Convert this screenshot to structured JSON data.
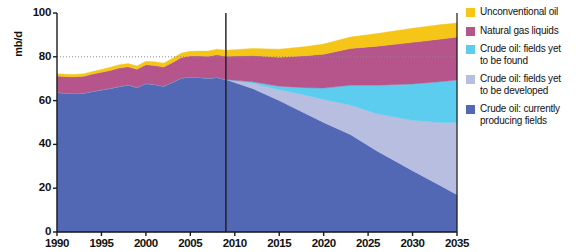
{
  "chart_data": {
    "type": "area",
    "title": "",
    "subtitle": "",
    "xlabel": "",
    "ylabel": "mb/d",
    "xlim": [
      1990,
      2035
    ],
    "ylim": [
      0,
      100
    ],
    "grid": "dotted horizontal gridline at 80 mb/d",
    "legend_position": "right",
    "stacked": true,
    "annotations": [
      {
        "type": "vertical-line",
        "x": 2009,
        "label": "historical / projection divider"
      }
    ],
    "x_tick_labels": [
      "1990",
      "1995",
      "2000",
      "2005",
      "2010",
      "2015",
      "2020",
      "2025",
      "2030",
      "2035"
    ],
    "y_tick_labels": [
      "0",
      "20",
      "40",
      "60",
      "80",
      "100"
    ],
    "x": [
      1990,
      1991,
      1992,
      1993,
      1994,
      1995,
      1996,
      1997,
      1998,
      1999,
      2000,
      2001,
      2002,
      2003,
      2004,
      2005,
      2006,
      2007,
      2008,
      2009,
      2012,
      2015,
      2018,
      2020,
      2023,
      2026,
      2030,
      2033,
      2035
    ],
    "series": [
      {
        "name": "Crude oil: currently producing fields",
        "color": "#5268B5",
        "values": [
          63.8,
          63.4,
          63.2,
          63.4,
          64.2,
          64.9,
          65.6,
          66.4,
          67.2,
          66.0,
          67.8,
          67.4,
          66.6,
          68.4,
          70.3,
          70.8,
          70.6,
          70.2,
          70.6,
          69.6,
          65.5,
          60.0,
          54.0,
          50.0,
          44.5,
          37.0,
          28.0,
          21.5,
          17.0
        ]
      },
      {
        "name": "Crude oil: fields yet to be developed",
        "color": "#B8BEE0",
        "values": [
          0,
          0,
          0,
          0,
          0,
          0,
          0,
          0,
          0,
          0,
          0,
          0,
          0,
          0,
          0,
          0,
          0,
          0,
          0,
          0,
          2.5,
          5.0,
          8.5,
          10.5,
          13.5,
          17.0,
          23.0,
          28.5,
          33.0
        ]
      },
      {
        "name": "Crude oil: fields yet to be found",
        "color": "#5CCDEE",
        "values": [
          0,
          0,
          0,
          0,
          0,
          0,
          0,
          0,
          0,
          0,
          0,
          0,
          0,
          0,
          0,
          0,
          0,
          0,
          0,
          0,
          0.6,
          1.6,
          3.4,
          5.2,
          9.0,
          13.0,
          16.6,
          18.6,
          19.4
        ]
      },
      {
        "name": "Natural gas liquids",
        "color": "#B5558C",
        "values": [
          7.4,
          7.5,
          7.6,
          7.7,
          7.9,
          8.0,
          8.2,
          8.5,
          8.2,
          8.3,
          8.6,
          8.6,
          8.7,
          9.0,
          9.4,
          9.6,
          9.8,
          10.0,
          10.3,
          10.6,
          12.0,
          13.2,
          14.6,
          15.5,
          16.8,
          17.8,
          19.0,
          19.4,
          19.6
        ]
      },
      {
        "name": "Unconventional oil",
        "color": "#F5C518",
        "values": [
          1.1,
          1.1,
          1.1,
          1.2,
          1.2,
          1.3,
          1.4,
          1.5,
          1.5,
          1.5,
          1.6,
          1.7,
          1.8,
          1.9,
          2.0,
          2.1,
          2.2,
          2.4,
          2.6,
          2.8,
          3.2,
          3.7,
          4.2,
          4.6,
          5.2,
          5.8,
          6.4,
          6.6,
          6.4
        ]
      }
    ]
  },
  "axes": {
    "y_unit": "mb/d",
    "y_ticks": [
      {
        "value": 100,
        "label": "100"
      },
      {
        "value": 80,
        "label": "80"
      },
      {
        "value": 60,
        "label": "60"
      },
      {
        "value": 40,
        "label": "40"
      },
      {
        "value": 20,
        "label": "20"
      },
      {
        "value": 0,
        "label": "0"
      }
    ],
    "x_ticks": [
      {
        "value": 1990,
        "label": "1990"
      },
      {
        "value": 1995,
        "label": "1995"
      },
      {
        "value": 2000,
        "label": "2000"
      },
      {
        "value": 2005,
        "label": "2005"
      },
      {
        "value": 2010,
        "label": "2010"
      },
      {
        "value": 2015,
        "label": "2015"
      },
      {
        "value": 2020,
        "label": "2020"
      },
      {
        "value": 2025,
        "label": "2025"
      },
      {
        "value": 2030,
        "label": "2030"
      },
      {
        "value": 2035,
        "label": "2035"
      }
    ]
  },
  "legend": {
    "items": [
      {
        "label": "Unconventional oil",
        "color": "#F5C518",
        "key": "unconventional-oil"
      },
      {
        "label": "Natural gas liquids",
        "color": "#B5558C",
        "key": "natural-gas-liquids"
      },
      {
        "label": "Crude oil: fields yet\nto be found",
        "color": "#5CCDEE",
        "key": "crude-oil-fields-yet-to-be-found"
      },
      {
        "label": "Crude oil: fields yet\nto be developed",
        "color": "#B8BEE0",
        "key": "crude-oil-fields-yet-to-be-developed"
      },
      {
        "label": "Crude oil: currently\nproducing fields",
        "color": "#5268B5",
        "key": "crude-oil-currently-producing-fields"
      }
    ]
  }
}
